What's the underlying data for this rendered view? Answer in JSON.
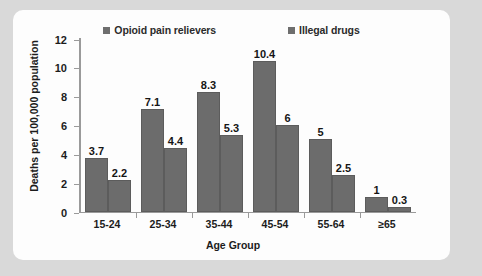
{
  "chart_data": {
    "type": "bar",
    "title": "",
    "subtitle": "",
    "xlabel": "Age Group",
    "ylabel": "Deaths per 100,000 population",
    "categories": [
      "15-24",
      "25-34",
      "35-44",
      "45-54",
      "55-64",
      "≥65"
    ],
    "series": [
      {
        "name": "Opioid pain relievers",
        "color": "#6c6c6c",
        "values": [
          3.7,
          7.1,
          8.3,
          10.4,
          5,
          1
        ],
        "labels": [
          "3.7",
          "7.1",
          "8.3",
          "10.4",
          "5",
          "1"
        ]
      },
      {
        "name": "Illegal drugs",
        "color": "#6c6c6c",
        "values": [
          2.2,
          4.4,
          5.3,
          6,
          2.5,
          0.3
        ],
        "labels": [
          "2.2",
          "4.4",
          "5.3",
          "6",
          "2.5",
          "0.3"
        ]
      }
    ],
    "ylim": [
      0,
      12
    ],
    "yticks": [
      0,
      2,
      4,
      6,
      8,
      10,
      12
    ],
    "ytick_labels": [
      "0",
      "2",
      "4",
      "6",
      "8",
      "10",
      "12"
    ],
    "grid": false,
    "legend_position": "top",
    "data_labels_shown": true
  },
  "figure": {
    "frame_color": "#d9d9d9",
    "panel_color": "#fdfdfd",
    "axis_color": "#9a9a9a",
    "text_color": "#1c1c1c"
  }
}
